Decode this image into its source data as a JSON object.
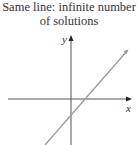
{
  "title": {
    "line1": "Same line: infinite number",
    "line2": "of solutions"
  },
  "axes": {
    "x_label": "x",
    "y_label": "y"
  },
  "colors": {
    "axis": "#555555",
    "line": "#9a9a9a",
    "text": "#333333"
  }
}
